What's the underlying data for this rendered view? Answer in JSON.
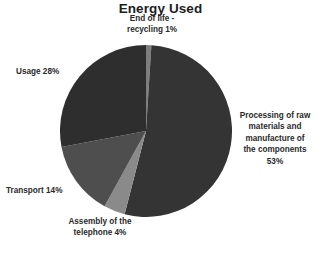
{
  "chart_data": {
    "type": "pie",
    "title": "Energy Used",
    "xlabel": "",
    "ylabel": "",
    "legend_position": "none",
    "grid": false,
    "labels_outside": true,
    "start_angle_deg": 0,
    "direction": "clockwise",
    "categories": [
      "End of life - recycling",
      "Processing of raw materials and manufacture of the components",
      "Assembly of the telephone",
      "Transport",
      "Usage"
    ],
    "values": [
      1,
      53,
      4,
      14,
      28
    ],
    "unit": "%",
    "colors": [
      "#7e7e7e",
      "#343434",
      "#8a8a8a",
      "#4e4e4e",
      "#2e2e2e"
    ],
    "slices": [
      {
        "name": "End of life - recycling",
        "value": 1,
        "color": "#7e7e7e",
        "label_lines": [
          "End of life -",
          "recycling 1%"
        ]
      },
      {
        "name": "Processing of raw materials and manufacture of the components",
        "value": 53,
        "color": "#343434",
        "label_lines": [
          "Processing of raw",
          "materials and",
          "manufacture of",
          "the components",
          "53%"
        ]
      },
      {
        "name": "Assembly of the telephone",
        "value": 4,
        "color": "#8a8a8a",
        "label_lines": [
          "Assembly of the",
          "telephone 4%"
        ]
      },
      {
        "name": "Transport",
        "value": 14,
        "color": "#4e4e4e",
        "label_lines": [
          "Transport 14%"
        ]
      },
      {
        "name": "Usage",
        "value": 28,
        "color": "#2e2e2e",
        "label_lines": [
          "Usage 28%"
        ]
      }
    ]
  },
  "style": {
    "background": "#ffffff",
    "text_color": "#2a2a2a",
    "title_color": "#1d1d1d"
  }
}
